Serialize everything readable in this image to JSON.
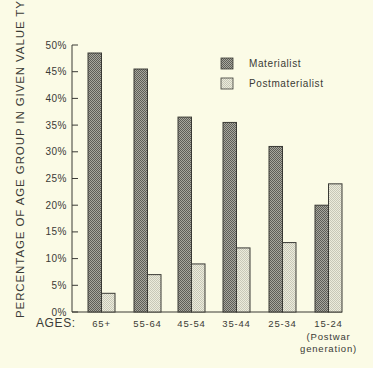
{
  "chart_data": {
    "type": "bar",
    "title": "",
    "xlabel": "AGES:",
    "ylabel": "PERCENTAGE OF AGE GROUP IN GIVEN VALUE TYPE",
    "categories": [
      "65+",
      "55-64",
      "45-54",
      "35-44",
      "25-34",
      "15-24"
    ],
    "category_sublabels": [
      "",
      "",
      "",
      "",
      "",
      "(Postwar generation)"
    ],
    "series": [
      {
        "name": "Materialist",
        "values": [
          48.5,
          45.5,
          36.5,
          35.5,
          31,
          20
        ],
        "color": "#8c8c84"
      },
      {
        "name": "Postmaterialist",
        "values": [
          3.5,
          7,
          9,
          12,
          13,
          24
        ],
        "color": "#e4e4d4"
      }
    ],
    "ylim": [
      0,
      50
    ],
    "yticks": [
      "0%",
      "5%",
      "10%",
      "15%",
      "20%",
      "25%",
      "30%",
      "35%",
      "40%",
      "45%",
      "50%"
    ],
    "grid": false,
    "legend_position": "upper right"
  },
  "labels": {
    "ylabel": "PERCENTAGE OF AGE GROUP IN GIVEN VALUE TYPE",
    "xlabel": "AGES:",
    "legend_materialist": "Materialist",
    "legend_postmaterialist": "Postmaterialist",
    "postwar_line1": "(Postwar",
    "postwar_line2": "generation)"
  }
}
